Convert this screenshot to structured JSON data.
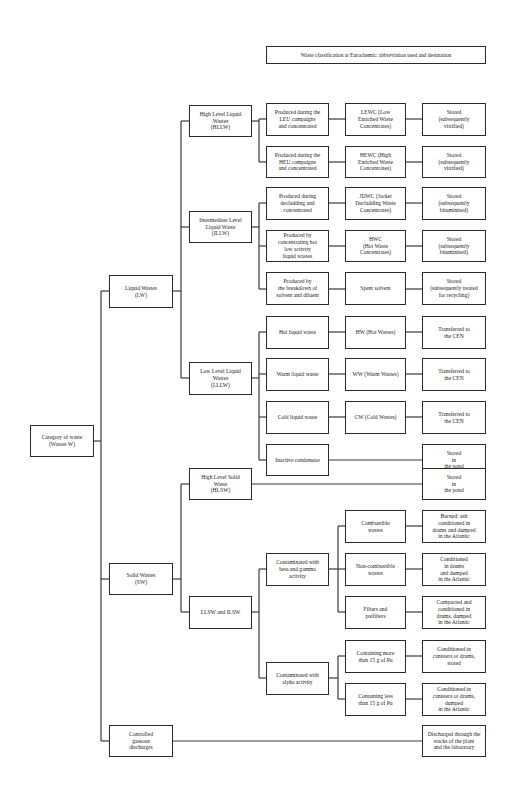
{
  "title": "Waste classification at Eurochemic: abbreviation used and destination",
  "root": {
    "label": "Category of waste\n(Wastes W)"
  },
  "categories": {
    "liquid": {
      "label": "Liquid Wastes\n(LW)"
    },
    "solid": {
      "label": "Solid Wastes\n(SW)"
    },
    "gaseous": {
      "label": "Controlled\ngaseous\ndischarges"
    }
  },
  "liquid_levels": {
    "hllw": {
      "label": "High Level Liquid\nWastes\n(HLLW)"
    },
    "illw": {
      "label": "Intermediate Level\nLiquid Waste\n(ILLW)"
    },
    "lllw": {
      "label": "Low Level Liquid\nWastes\n(LLLW)"
    }
  },
  "solid_levels": {
    "hlsw": {
      "label": "High Level Solid\nWaste\n(HLSW)"
    },
    "llsw": {
      "label": "LLSW and ILSW"
    }
  },
  "liquid_rows": [
    {
      "origin": "Produced during the\nLEU campaigns\nand concentrated",
      "abbr": "LEWC (Low\nEnriched Waste\nConcentrates)",
      "dest": "Stored\n(subsequently\nvitrified)"
    },
    {
      "origin": "Produced during the\nHEU campaigns\nand concentrated",
      "abbr": "HEWC (High\nEnriched Waste\nConcentrates)",
      "dest": "Stored\n(subsequently\nvitrified)"
    },
    {
      "origin": "Produced during\ndecladding and\nconcentrated",
      "abbr": "JDWC (Jacket\nDecladding Waste\nConcentrates)",
      "dest": "Stored\n(subsequently\nbituminised)"
    },
    {
      "origin": "Produced by\nconcentrating hot\nlow activity\nliquid wastes",
      "abbr": "HWC\n(Hot Waste\nConcentrates)",
      "dest": "Stored\n(subsequently\nbituminised)"
    },
    {
      "origin": "Produced by\nthe breakdown of\nsolvent and diluent",
      "abbr": "Spent solvent",
      "dest": "Stored\n(subsequently treated\nfor recycling)"
    },
    {
      "origin": "Hot liquid waste",
      "abbr": "HW (Hot Wastes)",
      "dest": "Transferred to\nthe CEN"
    },
    {
      "origin": "Warm liquid waste",
      "abbr": "WW (Warm Wastes)",
      "dest": "Transferred to\nthe CEN"
    },
    {
      "origin": "Cold liquid waste",
      "abbr": "CW (Cold Wastes)",
      "dest": "Transferred to\nthe CEN"
    },
    {
      "origin": "Inactive condensate",
      "abbr": "",
      "dest": "Stored\nin\nthe pond"
    }
  ],
  "hlsw_dest": "Stored\nin\nthe pond",
  "solid_groups": {
    "beta_gamma": {
      "label": "Contaminated with\nbeta and gamma\nactivity"
    },
    "alpha": {
      "label": "Contaminated with\nalpha activity"
    }
  },
  "solid_rows": [
    {
      "type": "Combustible\nwastes",
      "dest": "Burned: ash\nconditioned in\ndrums and dumped\nin the Atlantic"
    },
    {
      "type": "Non-combustible\nwastes",
      "dest": "Conditioned\nin drums\nand dumped\nin the Atlantic"
    },
    {
      "type": "Filters and\nprefilters",
      "dest": "Compacted and\nconditioned in\ndrums, dumped\nin the Atlantic"
    },
    {
      "type": "Containing more\nthan 15 g of Pu",
      "dest": "Conditioned in\ncanisters or drums,\nstored"
    },
    {
      "type": "Containing less\nthan 15 g of Pu",
      "dest": "Conditioned in\ncanisters or drums,\ndumped\nin the Atlantic"
    }
  ],
  "gaseous_dest": "Discharged through the\nstacks of the plant\nand the laboratory"
}
